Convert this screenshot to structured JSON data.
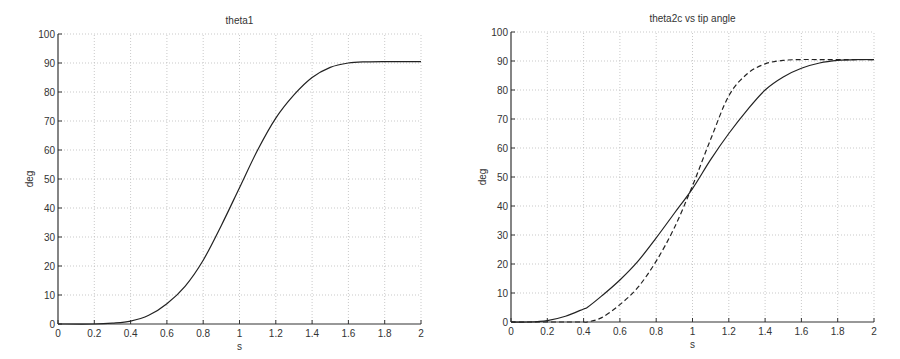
{
  "chart_data": [
    {
      "type": "line",
      "title": "theta1",
      "xlabel": "s",
      "ylabel": "deg",
      "xlim": [
        0,
        2
      ],
      "ylim": [
        0,
        100
      ],
      "xticks": [
        0,
        0.2,
        0.4,
        0.6,
        0.8,
        1,
        1.2,
        1.4,
        1.6,
        1.8,
        2
      ],
      "yticks": [
        0,
        10,
        20,
        30,
        40,
        50,
        60,
        70,
        80,
        90,
        100
      ],
      "grid": true,
      "x": [
        0,
        0.2,
        0.3,
        0.4,
        0.5,
        0.6,
        0.7,
        0.8,
        0.9,
        1.0,
        1.1,
        1.2,
        1.3,
        1.4,
        1.5,
        1.6,
        1.7,
        1.8,
        2.0
      ],
      "series": [
        {
          "name": "theta1",
          "style": "solid",
          "values": [
            0,
            0,
            0.3,
            1,
            3,
            7,
            13,
            22,
            34,
            47,
            60,
            71,
            79,
            85,
            88.5,
            90,
            90.4,
            90.5,
            90.5
          ]
        }
      ]
    },
    {
      "type": "line",
      "title": "theta2c vs tip angle",
      "xlabel": "s",
      "ylabel": "deg",
      "xlim": [
        0,
        2
      ],
      "ylim": [
        0,
        100
      ],
      "xticks": [
        0,
        0.2,
        0.4,
        0.6,
        0.8,
        1,
        1.2,
        1.4,
        1.6,
        1.8,
        2
      ],
      "yticks": [
        0,
        10,
        20,
        30,
        40,
        50,
        60,
        70,
        80,
        90,
        100
      ],
      "grid": true,
      "x": [
        0,
        0.1,
        0.2,
        0.3,
        0.4,
        0.42,
        0.5,
        0.6,
        0.7,
        0.8,
        0.9,
        1.0,
        1.1,
        1.2,
        1.3,
        1.4,
        1.5,
        1.6,
        1.7,
        1.8,
        1.9,
        2.0
      ],
      "series": [
        {
          "name": "theta2c",
          "style": "solid",
          "values": [
            0,
            0,
            0.5,
            2,
            4.5,
            5,
            9,
            14.5,
            21,
            29,
            37.5,
            46,
            56,
            65,
            73,
            80,
            84.5,
            87.5,
            89.3,
            90.2,
            90.5,
            90.5
          ]
        },
        {
          "name": "tip angle",
          "style": "dashed",
          "values": [
            0,
            0,
            0,
            0,
            0,
            0,
            1.5,
            6,
            12,
            21,
            32.5,
            47,
            63,
            78,
            85.5,
            89,
            90.2,
            90.5,
            90.5,
            90.5,
            90.5,
            90.5
          ]
        }
      ]
    }
  ]
}
